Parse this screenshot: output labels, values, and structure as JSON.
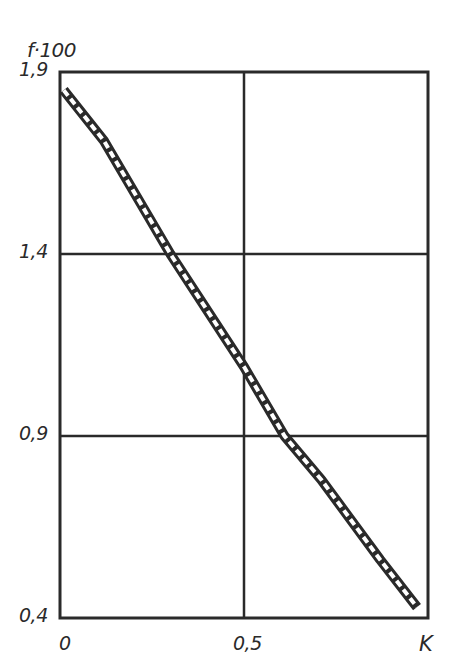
{
  "chart_data": {
    "type": "line",
    "title": "",
    "xlabel": "K",
    "ylabel": "f·100",
    "xlim": [
      0,
      1.0
    ],
    "ylim": [
      0.4,
      1.9
    ],
    "x_ticks": [
      0,
      0.5
    ],
    "x_tick_labels": [
      "0",
      "0,5"
    ],
    "y_ticks": [
      0.4,
      0.9,
      1.4,
      1.9
    ],
    "y_tick_labels": [
      "0,4",
      "0,9",
      "1,4",
      "1,9"
    ],
    "grid": true,
    "legend": null,
    "series": [
      {
        "name": "f·100 band",
        "style": "hatched band (double line with dashed fill)",
        "x": [
          0.01,
          0.12,
          0.3,
          0.5,
          0.61,
          0.71,
          0.87,
          0.97
        ],
        "values": [
          1.85,
          1.71,
          1.4,
          1.09,
          0.9,
          0.78,
          0.56,
          0.43
        ]
      }
    ]
  },
  "colors": {
    "ink": "#2a2a2a",
    "background": "#ffffff"
  }
}
